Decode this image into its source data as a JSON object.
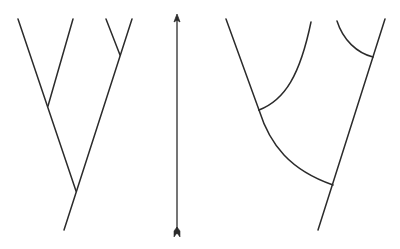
{
  "diagram": {
    "title": "",
    "stroke_color": "#2b2b2b",
    "stroke_width": 1.5,
    "panels": [
      {
        "id": "gradual-branching-tree",
        "description": "Phylogenetic tree with straight diagonal branches (gradualism)",
        "paths": [
          "M 18 19 L 76 191",
          "M 73 19 L 48 106",
          "M 132 19 L 64 230",
          "M 106 19 L 120 55"
        ]
      },
      {
        "id": "time-arrow",
        "description": "Vertical double-ended time axis arrow",
        "x": 177,
        "y_top": 14,
        "y_bottom": 236
      },
      {
        "id": "curved-branching-tree",
        "description": "Phylogenetic tree with curved branches",
        "paths": [
          "M 226 19 L 259 110",
          "M 259 110 C 270 145, 290 170, 333 185",
          "M 311 22 C 300 75, 285 100, 259 110",
          "M 385 19 L 318 230",
          "M 337 21 C 343 40, 357 53, 373 57"
        ]
      }
    ]
  }
}
